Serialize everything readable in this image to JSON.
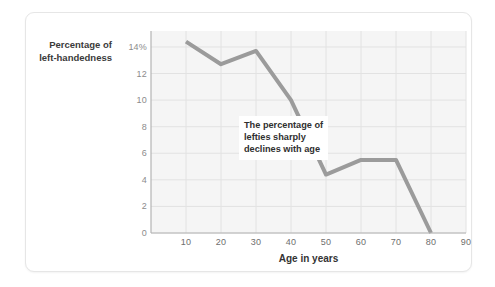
{
  "chart_data": {
    "type": "line",
    "title": "",
    "xlabel": "Age in years",
    "ylabel": "Percentage of left-handedness",
    "ylabel_lines": [
      "Percentage of",
      "left-handedness"
    ],
    "x": [
      10,
      20,
      30,
      40,
      50,
      60,
      70,
      80
    ],
    "values": [
      14.4,
      12.7,
      13.7,
      10.0,
      4.4,
      5.5,
      5.5,
      0.0
    ],
    "series": [
      {
        "name": "Percentage of left-handedness",
        "values": [
          14.4,
          12.7,
          13.7,
          10.0,
          4.4,
          5.5,
          5.5,
          0.0
        ]
      }
    ],
    "xlim": [
      0,
      90
    ],
    "ylim": [
      0,
      15.2
    ],
    "xticks": [
      10,
      20,
      30,
      40,
      50,
      60,
      70,
      80,
      90
    ],
    "xticklabels": [
      "10",
      "20",
      "30",
      "40",
      "50",
      "60",
      "70",
      "80",
      "90"
    ],
    "yticks": [
      0,
      2,
      4,
      6,
      8,
      10,
      12,
      14
    ],
    "yticklabels": [
      "0",
      "2",
      "4",
      "6",
      "8",
      "10",
      "12",
      "14%"
    ],
    "grid": true,
    "legend": false,
    "legend_position": "none",
    "annotations": [
      {
        "text": "The percentage of lefties sharply declines with age",
        "lines": [
          "The percentage of",
          "lefties sharply",
          "declines with age"
        ],
        "x": 57,
        "y": 8.2
      }
    ],
    "colors": {
      "line": "#9b9b9b",
      "plot_background": "#f5f5f5",
      "gridline": "#e2e2e2",
      "axis_line": "#b4b4b4",
      "card_background": "#ffffff",
      "card_border": "#e6e6e6",
      "tick_label": "#8c8c8c",
      "axis_title": "#333333",
      "annotation_text": "#2f2f2f"
    }
  }
}
